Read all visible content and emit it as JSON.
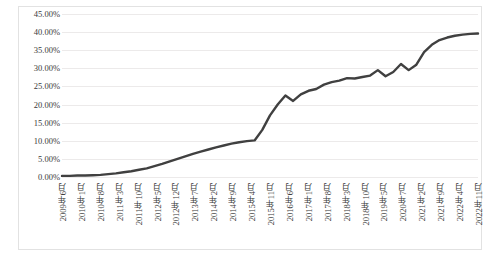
{
  "chart_data": {
    "type": "line",
    "title": "",
    "subtitle": "",
    "xlabel": "",
    "ylabel": "",
    "grid": true,
    "legend": false,
    "legend_position": "none",
    "line_color": "#404040",
    "gridline_color": "#ECEAEA",
    "border_color": "#E2E2E2",
    "ylim": [
      0,
      45
    ],
    "ytick_labels": [
      "0.00%",
      "5.00%",
      "10.00%",
      "15.00%",
      "20.00%",
      "25.00%",
      "30.00%",
      "35.00%",
      "40.00%",
      "45.00%"
    ],
    "ytick_values": [
      0,
      5,
      10,
      15,
      20,
      25,
      30,
      35,
      40,
      45
    ],
    "xtick_labels": [
      "2009年6月",
      "2010年1月",
      "2010年8月",
      "2011年3月",
      "2011年10月",
      "2012年5月",
      "2012年12月",
      "2013年7月",
      "2014年2月",
      "2014年9月",
      "2015年4月",
      "2015年11月",
      "2016年6月",
      "2017年1月",
      "2017年8月",
      "2018年3月",
      "2018年10月",
      "2019年5月",
      "2020年7月",
      "2021年2月",
      "2021年9月",
      "2022年4月",
      "2022年11月"
    ],
    "x": [
      "2009年6月",
      "2009年9月",
      "2009年12月",
      "2010年3月",
      "2010年6月",
      "2010年9月",
      "2010年12月",
      "2011年3月",
      "2011年6月",
      "2011年9月",
      "2011年12月",
      "2012年3月",
      "2012年6月",
      "2012年9月",
      "2012年12月",
      "2013年3月",
      "2013年6月",
      "2013年9月",
      "2013年12月",
      "2014年3月",
      "2014年6月",
      "2014年9月",
      "2014年12月",
      "2015年3月",
      "2015年6月",
      "2015年9月",
      "2015年12月",
      "2016年3月",
      "2016年6月",
      "2016年9月",
      "2016年12月",
      "2017年3月",
      "2017年6月",
      "2017年9月",
      "2017年12月",
      "2018年3月",
      "2018年6月",
      "2018年9月",
      "2018年12月",
      "2019年3月",
      "2019年6月",
      "2019年9月",
      "2019年12月",
      "2020年3月",
      "2020年6月",
      "2020年9月",
      "2020年12月",
      "2021年3月",
      "2021年6月",
      "2021年9月",
      "2021年12月",
      "2022年3月",
      "2022年6月",
      "2022年9月",
      "2022年11月"
    ],
    "values": [
      0.3,
      0.3,
      0.4,
      0.4,
      0.5,
      0.6,
      0.8,
      1.0,
      1.3,
      1.6,
      2.0,
      2.4,
      3.0,
      3.6,
      4.3,
      5.0,
      5.7,
      6.4,
      7.0,
      7.6,
      8.2,
      8.7,
      9.2,
      9.6,
      9.9,
      10.1,
      13.0,
      17.0,
      20.0,
      22.5,
      21.0,
      22.8,
      23.8,
      24.3,
      25.5,
      26.2,
      26.6,
      27.3,
      27.2,
      27.6,
      28.0,
      29.5,
      27.8,
      29.0,
      31.2,
      29.5,
      31.0,
      34.5,
      36.5,
      37.8,
      38.5,
      39.0,
      39.3,
      39.5,
      39.6
    ],
    "annotations": []
  }
}
